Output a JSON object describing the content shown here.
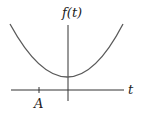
{
  "diagram": {
    "y_axis_label": "f(t)",
    "x_axis_label": "t",
    "tick_label": "A",
    "curve": "convex parabola with minimum above t-axis at t=0",
    "colors": {
      "curve": "#5a5a5a",
      "axis": "#333333",
      "text": "#222222"
    }
  }
}
